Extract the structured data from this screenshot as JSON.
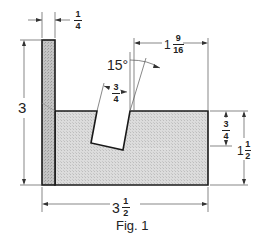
{
  "figure": {
    "caption": "Fig. 1",
    "colors": {
      "outline": "#1a1a1a",
      "upright_fill": "#b9b9b9",
      "base_fill": "#d6d6d6",
      "dimension_line": "#555555",
      "background": "#ffffff"
    }
  },
  "dimensions": {
    "upright_thickness": {
      "num": "1",
      "den": "4"
    },
    "overall_height": {
      "whole": "3"
    },
    "overall_width": {
      "whole": "3",
      "num": "1",
      "den": "2"
    },
    "slot_width": {
      "num": "3",
      "den": "4"
    },
    "slot_angle": "15°",
    "slot_to_right_edge": {
      "whole": "1",
      "num": "9",
      "den": "16"
    },
    "slot_depth": {
      "num": "3",
      "den": "4"
    },
    "base_height": {
      "whole": "1",
      "num": "1",
      "den": "2"
    }
  }
}
